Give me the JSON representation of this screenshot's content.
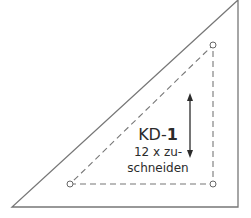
{
  "pattern_piece": {
    "id_prefix": "KD-",
    "id_number": "1",
    "instruction_line1": "12 x zu-",
    "instruction_line2": "schneiden"
  },
  "colors": {
    "background": "#ffffff",
    "outline": "#777777",
    "dashed_seam": "#777777",
    "text": "#2b2b2b",
    "arrow": "#2b2b2b"
  },
  "geometry": {
    "outer_triangle": [
      [
        12,
        207
      ],
      [
        238,
        207
      ],
      [
        238,
        0
      ]
    ],
    "seam_triangle": [
      [
        70,
        184
      ],
      [
        213,
        184
      ],
      [
        213,
        45
      ]
    ],
    "grain_arrow": {
      "x": 190,
      "y1": 93,
      "y2": 158
    }
  }
}
